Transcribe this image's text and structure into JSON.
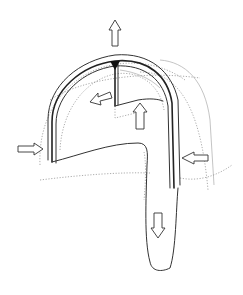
{
  "diagram": {
    "colors": {
      "line": "#333333",
      "dotted": "#888888",
      "background": "#ffffff"
    },
    "arrows": [
      {
        "id": "top",
        "direction": "up"
      },
      {
        "id": "inner-left",
        "direction": "down-left"
      },
      {
        "id": "inner-up",
        "direction": "up"
      },
      {
        "id": "left-side",
        "direction": "right"
      },
      {
        "id": "right-side",
        "direction": "left"
      },
      {
        "id": "bottom-tail",
        "direction": "down"
      }
    ]
  }
}
